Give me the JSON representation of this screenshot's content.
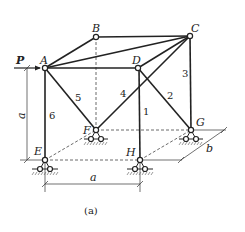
{
  "figure": {
    "caption": "(a)",
    "load_label": "P",
    "dimension_labels": {
      "height": "a",
      "width": "a",
      "depth": "b"
    },
    "nodes": {
      "A": "A",
      "B": "B",
      "C": "C",
      "D": "D",
      "E": "E",
      "F": "F",
      "G": "G",
      "H": "H"
    },
    "members": {
      "m1": "1",
      "m2": "2",
      "m3": "3",
      "m4": "4",
      "m5": "5",
      "m6": "6"
    },
    "supports": [
      "E",
      "F",
      "G",
      "H"
    ]
  }
}
